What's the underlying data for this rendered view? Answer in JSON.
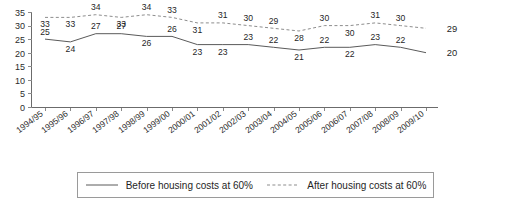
{
  "chart_data": {
    "type": "line",
    "title": "",
    "xlabel": "",
    "ylabel": "",
    "ylim": [
      0,
      35
    ],
    "yticks": [
      0,
      5,
      10,
      15,
      20,
      25,
      30,
      35
    ],
    "grid": false,
    "legend_position": "bottom",
    "categories": [
      "1994/95",
      "1995/96",
      "1996/97",
      "1997/98",
      "1998/99",
      "1999/00",
      "2000/01",
      "2001/02",
      "2002/03",
      "2003/04",
      "2004/05",
      "2005/06",
      "2006/07",
      "2007/08",
      "2008/09",
      "2009/10"
    ],
    "series": [
      {
        "name": "Before housing costs at 60%",
        "style": "solid",
        "color": "#5a5a5a",
        "values": [
          25,
          24,
          27,
          27,
          26,
          26,
          23,
          23,
          23,
          22,
          21,
          22,
          22,
          23,
          22,
          20
        ]
      },
      {
        "name": "After housing costs at 60%",
        "style": "dashed",
        "color": "#8d8d8d",
        "values": [
          33,
          33,
          34,
          33,
          34,
          33,
          31,
          31,
          30,
          29,
          28,
          30,
          30,
          31,
          30,
          29
        ]
      }
    ],
    "end_labels": {
      "before_housing_costs": "20",
      "after_housing_costs": "29"
    }
  },
  "legend": {
    "items": [
      {
        "label": "Before housing costs at 60%",
        "style": "solid"
      },
      {
        "label": "After housing costs at 60%",
        "style": "dashed"
      }
    ]
  }
}
